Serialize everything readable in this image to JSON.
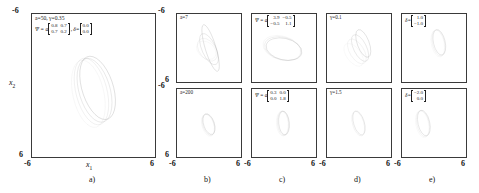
{
  "figure": {
    "axis_min": "-6",
    "axis_max": "6",
    "xlabel": "x",
    "xlabel_sub": "1",
    "ylabel": "x",
    "ylabel_sub": "2"
  },
  "panels": [
    {
      "letter": "a)",
      "name": "panel-a",
      "subplots": [
        {
          "name": "subplot-a",
          "annotation_lines": [
            "a=50,  γ=0.35"
          ],
          "psi_label": "Ψ = a",
          "psi_matrix": [
            "0.8",
            "0.7",
            "0.7",
            "0.2"
          ],
          "delta_label": "δ=",
          "delta_vector": [
            "0.0",
            "0.0"
          ]
        }
      ]
    },
    {
      "letter": "b)",
      "name": "panel-b",
      "subplots": [
        {
          "name": "subplot-b-top",
          "annotation_lines": [
            "a=7"
          ]
        },
        {
          "name": "subplot-b-bottom",
          "annotation_lines": [
            "a=200"
          ]
        }
      ]
    },
    {
      "letter": "c)",
      "name": "panel-c",
      "subplots": [
        {
          "name": "subplot-c-top",
          "psi_label": "Ψ = a",
          "psi_matrix": [
            "3.9",
            "−0.5",
            "−0.5",
            "1.1"
          ]
        },
        {
          "name": "subplot-c-bottom",
          "psi_label": "Ψ = a",
          "psi_matrix": [
            "0.3",
            "0.0",
            "0.0",
            "1.8"
          ]
        }
      ]
    },
    {
      "letter": "d)",
      "name": "panel-d",
      "subplots": [
        {
          "name": "subplot-d-top",
          "annotation_lines": [
            "γ=0.1"
          ]
        },
        {
          "name": "subplot-d-bottom",
          "annotation_lines": [
            "γ=1.5"
          ]
        }
      ]
    },
    {
      "letter": "e)",
      "name": "panel-e",
      "subplots": [
        {
          "name": "subplot-e-top",
          "delta_label": "δ=",
          "delta_vector": [
            "1.0",
            "−1.0"
          ]
        },
        {
          "name": "subplot-e-bottom",
          "delta_label": "δ=",
          "delta_vector": [
            "−2.0",
            "0.0"
          ]
        }
      ]
    }
  ],
  "chart_data": {
    "type": "scatter",
    "title": "",
    "xlabel": "x1",
    "ylabel": "x2",
    "xlim": [
      -6,
      6
    ],
    "ylim": [
      -6,
      6
    ],
    "grid": false,
    "legend": "none",
    "subplots": [
      {
        "id": "a",
        "params": {
          "a": 50,
          "gamma": 0.35,
          "Psi": [
            [
              0.8,
              0.7
            ],
            [
              0.7,
              0.2
            ]
          ],
          "delta": [
            0.0,
            0.0
          ]
        },
        "ellipses": [
          {
            "cx": 0.4,
            "cy": 0.2,
            "rx": 1.5,
            "ry": 2.8,
            "angle": -22,
            "gray": "#111111"
          },
          {
            "cx": 0.1,
            "cy": 0.4,
            "rx": 1.5,
            "ry": 2.8,
            "angle": -20,
            "gray": "#555555"
          },
          {
            "cx": -0.2,
            "cy": 0.5,
            "rx": 1.5,
            "ry": 2.9,
            "angle": -18,
            "gray": "#8c8c8c"
          },
          {
            "cx": -0.5,
            "cy": 0.7,
            "rx": 1.5,
            "ry": 2.9,
            "angle": -16,
            "gray": "#bdbdbd"
          }
        ]
      },
      {
        "id": "b-top",
        "params": {
          "a": 7
        },
        "ellipses": [
          {
            "cx": 0.3,
            "cy": 0.0,
            "rx": 1.0,
            "ry": 4.3,
            "angle": -18,
            "gray": "#111111"
          },
          {
            "cx": 0.0,
            "cy": 0.2,
            "rx": 1.3,
            "ry": 3.0,
            "angle": -26,
            "gray": "#4a4a4a"
          },
          {
            "cx": -0.3,
            "cy": 0.3,
            "rx": 1.5,
            "ry": 2.3,
            "angle": -40,
            "gray": "#9a9a9a"
          },
          {
            "cx": -0.5,
            "cy": 0.4,
            "rx": 1.4,
            "ry": 2.0,
            "angle": -55,
            "gray": "#c4c4c4"
          }
        ]
      },
      {
        "id": "b-bottom",
        "params": {
          "a": 200
        },
        "ellipses": [
          {
            "cx": 0.0,
            "cy": 0.2,
            "rx": 1.0,
            "ry": 1.9,
            "angle": -20,
            "gray": "#2a2a2a"
          },
          {
            "cx": -0.1,
            "cy": 0.3,
            "rx": 1.05,
            "ry": 1.95,
            "angle": -19,
            "gray": "#8a8a8a"
          },
          {
            "cx": -0.2,
            "cy": 0.4,
            "rx": 1.1,
            "ry": 2.0,
            "angle": -18,
            "gray": "#c0c0c0"
          }
        ]
      },
      {
        "id": "c-top",
        "params": {
          "Psi": [
            [
              3.9,
              -0.5
            ],
            [
              -0.5,
              1.1
            ]
          ]
        },
        "ellipses": [
          {
            "cx": 0.0,
            "cy": 0.2,
            "rx": 3.4,
            "ry": 1.9,
            "angle": 12,
            "gray": "#2a2a2a"
          },
          {
            "cx": -0.2,
            "cy": 0.1,
            "rx": 3.5,
            "ry": 2.0,
            "angle": 13,
            "gray": "#7a7a7a"
          },
          {
            "cx": -0.4,
            "cy": 0.0,
            "rx": 3.6,
            "ry": 2.1,
            "angle": 14,
            "gray": "#b5b5b5"
          }
        ]
      },
      {
        "id": "c-bottom",
        "params": {
          "Psi": [
            [
              0.3,
              0.0
            ],
            [
              0.0,
              1.8
            ]
          ]
        },
        "ellipses": [
          {
            "cx": 0.0,
            "cy": 0.0,
            "rx": 1.0,
            "ry": 2.1,
            "angle": -6,
            "gray": "#2a2a2a"
          },
          {
            "cx": -0.15,
            "cy": 0.05,
            "rx": 1.05,
            "ry": 2.15,
            "angle": -5,
            "gray": "#888888"
          },
          {
            "cx": -0.3,
            "cy": 0.1,
            "rx": 1.1,
            "ry": 2.2,
            "angle": -4,
            "gray": "#c0c0c0"
          }
        ]
      },
      {
        "id": "d-top",
        "params": {
          "gamma": 0.1
        },
        "ellipses": [
          {
            "cx": 0.8,
            "cy": -0.8,
            "rx": 1.1,
            "ry": 2.6,
            "angle": -22,
            "gray": "#111111"
          },
          {
            "cx": 0.2,
            "cy": 0.0,
            "rx": 1.2,
            "ry": 2.6,
            "angle": -28,
            "gray": "#4a4a4a"
          },
          {
            "cx": -0.4,
            "cy": 0.6,
            "rx": 1.3,
            "ry": 2.5,
            "angle": -34,
            "gray": "#9a9a9a"
          },
          {
            "cx": -1.0,
            "cy": 1.2,
            "rx": 1.3,
            "ry": 2.4,
            "angle": -40,
            "gray": "#c8c8c8"
          }
        ]
      },
      {
        "id": "d-bottom",
        "params": {
          "gamma": 1.5
        },
        "ellipses": [
          {
            "cx": 0.0,
            "cy": 0.0,
            "rx": 1.0,
            "ry": 2.2,
            "angle": -18,
            "gray": "#3a3a3a"
          },
          {
            "cx": -0.15,
            "cy": 0.1,
            "rx": 1.05,
            "ry": 2.25,
            "angle": -17,
            "gray": "#9e9e9e"
          }
        ]
      },
      {
        "id": "e-top",
        "params": {
          "delta": [
            1.0,
            -1.0
          ]
        },
        "ellipses": [
          {
            "cx": 1.0,
            "cy": -1.0,
            "rx": 1.1,
            "ry": 2.3,
            "angle": -14,
            "gray": "#3a3a3a"
          },
          {
            "cx": 0.85,
            "cy": -0.9,
            "rx": 1.15,
            "ry": 2.35,
            "angle": -13,
            "gray": "#9a9a9a"
          },
          {
            "cx": 0.7,
            "cy": -0.8,
            "rx": 1.2,
            "ry": 2.4,
            "angle": -12,
            "gray": "#c8c8c8"
          }
        ]
      },
      {
        "id": "e-bottom",
        "params": {
          "delta": [
            -2.0,
            0.0
          ]
        },
        "ellipses": [
          {
            "cx": -1.9,
            "cy": 0.0,
            "rx": 1.1,
            "ry": 2.3,
            "angle": -14,
            "gray": "#3a3a3a"
          },
          {
            "cx": -2.05,
            "cy": 0.1,
            "rx": 1.15,
            "ry": 2.35,
            "angle": -13,
            "gray": "#9a9a9a"
          },
          {
            "cx": -2.2,
            "cy": 0.2,
            "rx": 1.2,
            "ry": 2.4,
            "angle": -12,
            "gray": "#c8c8c8"
          }
        ]
      }
    ]
  }
}
